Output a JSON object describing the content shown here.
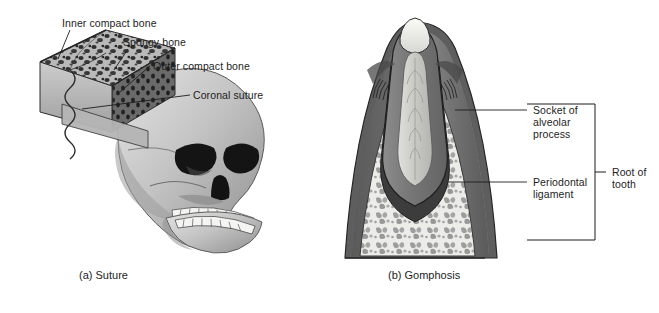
{
  "figure": {
    "background_color": "#ffffff",
    "line_color": "#1d1d1d",
    "text_color": "#1d1d1d"
  },
  "panel_a": {
    "caption": "(a) Suture",
    "labels": [
      {
        "id": "inner-compact-bone",
        "text": "Inner compact bone"
      },
      {
        "id": "spongy-bone",
        "text": "Spongy bone"
      },
      {
        "id": "outer-compact-bone",
        "text": "Outer compact bone"
      },
      {
        "id": "coronal-suture",
        "text": "Coronal suture"
      }
    ],
    "structures": [
      {
        "id": "bone-block",
        "name": "cut bone block with wavy suture"
      },
      {
        "id": "skull",
        "name": "lateral skull illustration"
      }
    ],
    "colors": {
      "bone_light": "#c9c9c9",
      "bone_mid": "#a8a8a8",
      "bone_dark": "#6e6e6e",
      "spongy_speckle": "#3a3a3a",
      "skull_light": "#d2d2d2",
      "skull_shadow": "#8a8a8a",
      "cavity_dark": "#1c1c1c",
      "teeth": "#f2f2f2"
    }
  },
  "panel_b": {
    "caption": "(b) Gomphosis",
    "labels": [
      {
        "id": "socket-of-alveolar-process",
        "text": "Socket of\nalveolar\nprocess"
      },
      {
        "id": "periodontal-ligament",
        "text": "Periodontal\nligament"
      },
      {
        "id": "root-of-tooth",
        "text": "Root of\ntooth"
      }
    ],
    "bracket": {
      "id": "root-of-tooth-bracket",
      "orientation": "vertical"
    },
    "structures": [
      {
        "id": "tooth",
        "name": "tooth cross-section"
      },
      {
        "id": "pulp-cavity",
        "name": "pulp cavity"
      },
      {
        "id": "gingiva",
        "name": "gum tissue"
      },
      {
        "id": "spongy-bone",
        "name": "alveolar spongy bone"
      }
    ],
    "colors": {
      "enamel": "#efefec",
      "dentin": "#7d7d7d",
      "pulp": "#cfcfcb",
      "gum_dark": "#5f5f5f",
      "gum_mid": "#8e8e8e",
      "bone_bg": "#e6e6e2",
      "trabeculae": "#9a9a9a",
      "outline": "#2a2a2a"
    }
  }
}
